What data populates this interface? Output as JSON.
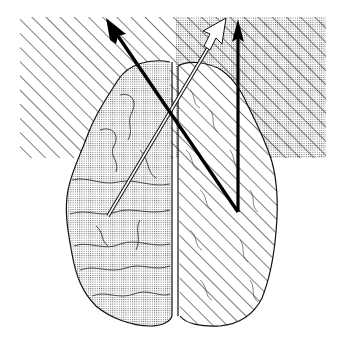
{
  "figure": {
    "type": "brain-diagram",
    "view": "dorsal (top-down) view of the brain",
    "colors": {
      "background": "#ffffff",
      "ink": "#111111",
      "stipple": "#555555",
      "white_arrow_fill": "#ffffff"
    },
    "regions": [
      {
        "id": "left-field",
        "pattern": "diagonal-hatch",
        "description": "Left visual/spatial field, hatched"
      },
      {
        "id": "right-field",
        "pattern": "dots-and-hatch",
        "description": "Right field, stippled with diagonal hatching"
      },
      {
        "id": "left-hemisphere",
        "pattern": "dots",
        "description": "Left hemisphere, stippled"
      },
      {
        "id": "right-hemisphere",
        "pattern": "diagonal-hatch",
        "description": "Right hemisphere, hatched"
      }
    ],
    "arrows": [
      {
        "id": "black-diagonal-arrow",
        "fill": "black",
        "from": "right hemisphere",
        "to": "left field"
      },
      {
        "id": "white-diagonal-arrow",
        "fill": "white",
        "from": "left hemisphere",
        "to": "right field"
      },
      {
        "id": "black-vertical-arrow",
        "fill": "black",
        "from": "right hemisphere",
        "to": "right field"
      }
    ]
  }
}
